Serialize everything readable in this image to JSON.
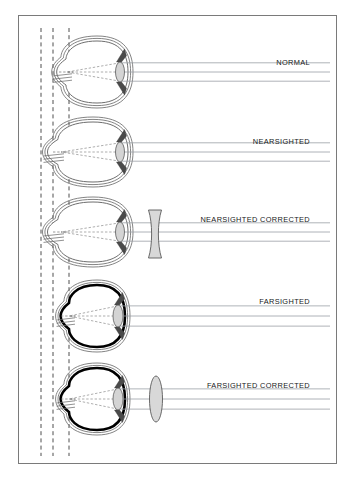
{
  "figure": {
    "background_color": "#ffffff",
    "border_color": "#7a7a7a",
    "frame": {
      "x": 18,
      "y": 15,
      "width": 319,
      "height": 449
    }
  },
  "reference_lines": {
    "name": "vertical-dashed-reference-lines",
    "count": 3,
    "x_positions": [
      41,
      53,
      69
    ],
    "y_top": 28,
    "y_bottom": 456,
    "style": "dashed",
    "color": "#3a3a3a"
  },
  "rays": {
    "name": "light-rays",
    "count": 3,
    "color": "#9aa0a6",
    "entry_x": 330,
    "description": "Three parallel horizontal light rays entering from the right, refracting through the lens toward a focal point."
  },
  "diagrams": [
    {
      "id": "normal",
      "label": "NORMAL",
      "label_x": 310,
      "label_y": 62,
      "eye": {
        "cx": 97,
        "cy": 72,
        "rx": 31,
        "ry": 31,
        "outline": "thin",
        "outline_color": "#6e6e6e",
        "lens_cx": 120,
        "lens_ry": 10,
        "lens_rx": 4.5,
        "focus_x": 67,
        "focal_on_retina": true
      },
      "corrective_lens": null
    },
    {
      "id": "nearsighted",
      "label": "NEARSIGHTED",
      "label_x": 310,
      "label_y": 141,
      "eye": {
        "cx": 93,
        "cy": 152,
        "rx": 35,
        "ry": 30,
        "outline": "thin",
        "outline_color": "#6e6e6e",
        "lens_cx": 120,
        "lens_ry": 10,
        "lens_rx": 4.5,
        "focus_x": 61,
        "focal_on_retina": false
      },
      "corrective_lens": null
    },
    {
      "id": "nearsighted-corrected",
      "label": "NEARSIGHTED CORRECTED",
      "label_x": 310,
      "label_y": 219,
      "eye": {
        "cx": 93,
        "cy": 232,
        "rx": 35,
        "ry": 30,
        "outline": "thin",
        "outline_color": "#6e6e6e",
        "lens_cx": 120,
        "lens_ry": 10,
        "lens_rx": 4.5,
        "focus_x": 61,
        "focal_on_retina": true
      },
      "corrective_lens": {
        "type": "concave",
        "shape": "diverging-hourglass",
        "cx": 155,
        "cy": 234,
        "half_height": 24,
        "waist": 2.6,
        "flare": 6.5,
        "fill": "#d8d8d8"
      }
    },
    {
      "id": "farsighted",
      "label": "FARSIGHTED",
      "label_x": 310,
      "label_y": 301,
      "eye": {
        "cx": 97,
        "cy": 316,
        "rx": 28,
        "ry": 31,
        "outline": "thick",
        "outline_color": "#000000",
        "lens_cx": 118,
        "lens_ry": 11,
        "lens_rx": 5,
        "focus_x": 69,
        "focal_on_retina": false
      },
      "corrective_lens": null
    },
    {
      "id": "farsighted-corrected",
      "label": "FARSIGHTED CORRECTED",
      "label_x": 310,
      "label_y": 385,
      "eye": {
        "cx": 97,
        "cy": 399,
        "rx": 28,
        "ry": 31,
        "outline": "thick",
        "outline_color": "#000000",
        "lens_cx": 118,
        "lens_ry": 11,
        "lens_rx": 5,
        "focus_x": 69,
        "focal_on_retina": true
      },
      "corrective_lens": {
        "type": "convex",
        "shape": "converging-ellipse",
        "cx": 156,
        "cy": 399,
        "rx": 6.5,
        "ry": 23,
        "fill": "#d8d8d8"
      }
    }
  ]
}
